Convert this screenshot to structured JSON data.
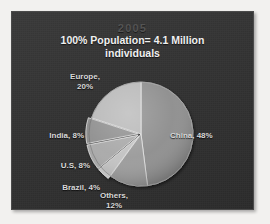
{
  "figure": {
    "name": "population-pie-chart",
    "background_color": "#323232",
    "panel_border_color": "#4a4a4a",
    "text_color": "#d8d8d8",
    "title_color": "#f0f0f0",
    "year_color": "#545454"
  },
  "titles": {
    "year": "2005",
    "main_line1": "100% Population= 4.1 Million",
    "main_line2": "individuals"
  },
  "labels": {
    "europe": {
      "line1": "Europe,",
      "line2": "20%"
    },
    "india": {
      "text": "India, 8%"
    },
    "us": {
      "text": "U.S, 8%"
    },
    "brazil": {
      "text": "Brazil, 4%"
    },
    "others": {
      "line1": "Others,",
      "line2": "12%"
    },
    "china": {
      "text": "China, 48%"
    }
  },
  "chart_data": {
    "type": "pie",
    "subtitle": "100% Population= 4.1 Million individuals",
    "year": "2005",
    "total_label": "100% Population= 4.1 Million individuals",
    "total_value": 4.1,
    "total_units": "Million individuals",
    "categories": [
      "China",
      "Others",
      "Brazil",
      "U.S",
      "India",
      "Europe"
    ],
    "values": [
      48,
      12,
      4,
      8,
      8,
      20
    ],
    "value_units": "percent",
    "labels": [
      "China, 48%",
      "Others, 12%",
      "Brazil, 4%",
      "U.S, 8%",
      "India, 8%",
      "Europe, 20%"
    ],
    "colors": [
      "#8d8d8d",
      "#9a9a9a",
      "#c2c2c2",
      "#a8a8a8",
      "#8f8f8f",
      "#b8b8b8"
    ],
    "start_angle_deg": 0,
    "direction": "clockwise",
    "exploded_slices": [
      "Brazil",
      "U.S",
      "India"
    ],
    "legend": "none",
    "grid": false,
    "sum": 100
  }
}
